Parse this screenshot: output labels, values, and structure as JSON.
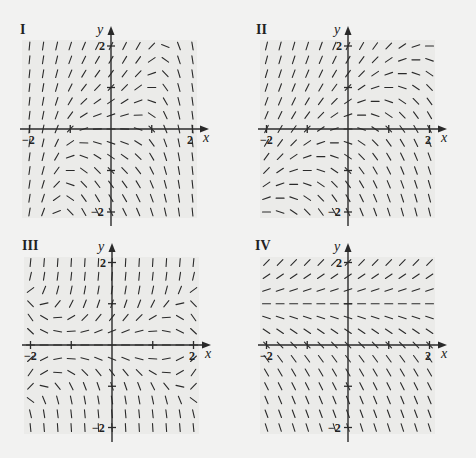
{
  "chart_data": [
    {
      "type": "slope_field",
      "title": "I",
      "xlabel": "x",
      "ylabel": "y",
      "xlim": [
        -2,
        2
      ],
      "ylim": [
        -2,
        2
      ],
      "xticks": [
        -2,
        -1,
        0,
        1,
        2
      ],
      "yticks": [
        -2,
        -1,
        0,
        1,
        2
      ],
      "tick_labels": {
        "x_neg": "-2",
        "x_pos": "2",
        "y_pos": "2",
        "y_neg": "-2"
      },
      "grid_n": 13,
      "slope_rule": "y - x^3",
      "frame": {
        "left": 28,
        "right": 191,
        "top": 46,
        "bottom": 212,
        "ox": 111,
        "oy": 129
      }
    },
    {
      "type": "slope_field",
      "title": "II",
      "xlabel": "x",
      "ylabel": "y",
      "xlim": [
        -2,
        2
      ],
      "ylim": [
        -2,
        2
      ],
      "xticks": [
        -2,
        -1,
        0,
        1,
        2
      ],
      "yticks": [
        -2,
        -1,
        0,
        1,
        2
      ],
      "tick_labels": {
        "x_neg": "-2",
        "x_pos": "2",
        "y_pos": "2",
        "y_neg": "-2"
      },
      "grid_n": 13,
      "slope_rule": "y - x",
      "frame": {
        "left": 266,
        "right": 429,
        "top": 46,
        "bottom": 212,
        "ox": 348,
        "oy": 129
      }
    },
    {
      "type": "slope_field",
      "title": "III",
      "xlabel": "x",
      "ylabel": "y",
      "xlim": [
        -2,
        2
      ],
      "ylim": [
        -2,
        2
      ],
      "xticks": [
        -2,
        -1,
        0,
        1,
        2
      ],
      "yticks": [
        -2,
        -1,
        0,
        1,
        2
      ],
      "tick_labels": {
        "x_neg": "-2",
        "x_pos": "2",
        "y_pos": "2",
        "y_neg": "-2"
      },
      "grid_n": 13,
      "slope_rule": "y*(2*y*y - x*x + 1)",
      "frame": {
        "left": 30,
        "right": 193,
        "top": 263,
        "bottom": 428,
        "ox": 112,
        "oy": 345
      }
    },
    {
      "type": "slope_field",
      "title": "IV",
      "xlabel": "x",
      "ylabel": "y",
      "xlim": [
        -2,
        2
      ],
      "ylim": [
        -2,
        2
      ],
      "xticks": [
        -2,
        -1,
        0,
        1,
        2
      ],
      "yticks": [
        -2,
        -1,
        0,
        1,
        2
      ],
      "tick_labels": {
        "x_neg": "-2",
        "x_pos": "2",
        "y_pos": "2",
        "y_neg": "-2"
      },
      "grid_n": 13,
      "slope_rule": "y - 1",
      "frame": {
        "left": 266,
        "right": 429,
        "top": 263,
        "bottom": 428,
        "ox": 348,
        "oy": 345
      }
    }
  ],
  "panels": [
    {
      "label": "I"
    },
    {
      "label": "II"
    },
    {
      "label": "III"
    },
    {
      "label": "IV"
    }
  ],
  "colors": {
    "ink": "#2a2a2a",
    "background": "#f2f2f1",
    "field_bg": "#e6e6e5"
  }
}
